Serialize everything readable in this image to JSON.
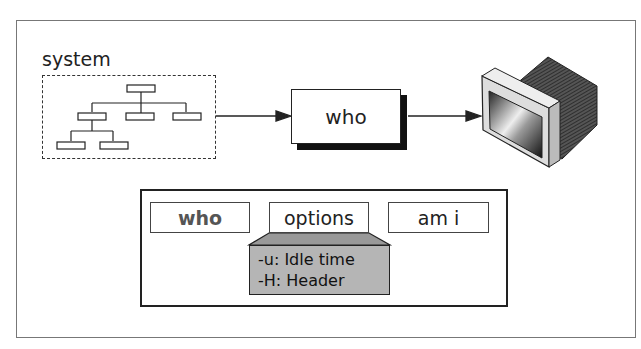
{
  "diagram": {
    "system_label": "system",
    "process_label": "who",
    "command_parts": [
      {
        "label": "who"
      },
      {
        "label": "options"
      },
      {
        "label": "am i"
      }
    ],
    "options_list": [
      {
        "label": "-u: Idle time"
      },
      {
        "label": "-H: Header"
      }
    ],
    "icons": {
      "system_tree": "hierarchy-tree-icon",
      "output": "monitor-icon"
    },
    "colors": {
      "panel_gray": "#b5b5b5",
      "who_text_gray": "#555555",
      "line": "#222222"
    }
  }
}
